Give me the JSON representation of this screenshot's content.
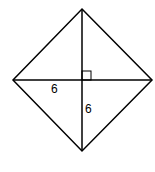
{
  "diagram": {
    "type": "rhombus-with-diagonals",
    "shape": "square rotated 45 degrees (rhombus)",
    "vertices": {
      "top": [
        82,
        9
      ],
      "right": [
        152,
        80
      ],
      "bottom": [
        82,
        151
      ],
      "left": [
        13,
        80
      ]
    },
    "center": [
      82,
      80
    ],
    "right_angle_marker": {
      "x": 82,
      "y": 71,
      "size": 9
    },
    "labels": {
      "horizontal_half_diagonal": "6",
      "vertical_half_diagonal": "6"
    },
    "colors": {
      "stroke": "#000000",
      "background": "#ffffff"
    }
  }
}
